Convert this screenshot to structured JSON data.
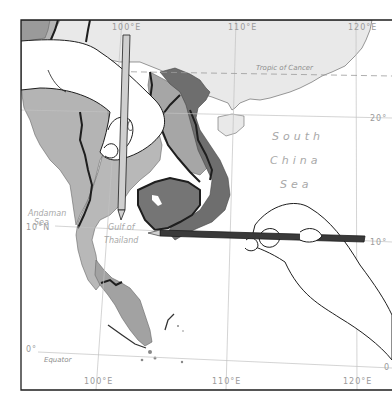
{
  "map": {
    "region": "Southeast Asia",
    "graticule": {
      "longitudes": [
        {
          "label_top": "100°E",
          "label_bottom": "100°E"
        },
        {
          "label_top": "110°E",
          "label_bottom": "110°E"
        },
        {
          "label_top": "120°E",
          "label_bottom": "120°E"
        }
      ],
      "latitudes": [
        {
          "label": "20°"
        },
        {
          "label": "10°N",
          "label_right": "10°"
        },
        {
          "label": "0°",
          "label_right": "0"
        }
      ]
    },
    "lines": {
      "tropic": "Tropic of Cancer",
      "equator": "Equator"
    },
    "water_labels": {
      "andaman_1": "Andaman",
      "andaman_2": "Sea",
      "gulf_1": "Gulf of",
      "gulf_2": "Thailand",
      "scs_1": "South",
      "scs_2": "China",
      "scs_3": "Sea"
    },
    "colors": {
      "land_light": "#e9e9e9",
      "land_mid": "#b4b4b4",
      "land_medium": "#9a9a9a",
      "land_dark": "#6e6e6e",
      "border": "#1e1e1e",
      "graticule": "#bdbdbd",
      "pencil_light": "#cfcfcf",
      "pencil_dark": "#3a3a3a"
    }
  },
  "illustrations": {
    "left_hand": "hand holding vertical pencil",
    "right_hand": "hand holding horizontal pencil"
  }
}
